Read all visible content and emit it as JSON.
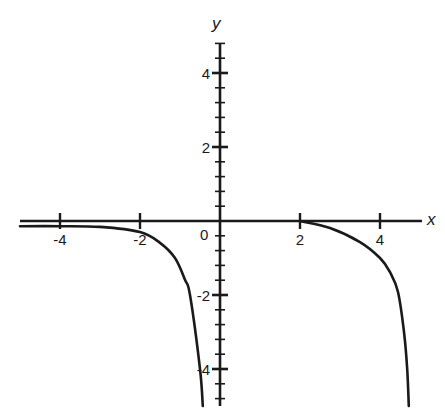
{
  "chart_data": {
    "type": "line",
    "title": "",
    "xlabel": "x",
    "ylabel": "y",
    "xlim": [
      -5,
      5
    ],
    "ylim": [
      -5,
      4.8
    ],
    "grid": false,
    "legend": null,
    "x_ticks": [
      -4,
      -2,
      2,
      4
    ],
    "x_tick_labels": [
      "-4",
      "-2",
      "2",
      "4"
    ],
    "y_ticks": [
      4,
      2,
      -2,
      -4
    ],
    "y_tick_labels": [
      "4",
      "2",
      "-2",
      "-4"
    ],
    "y_minor_tick_step": 0.4,
    "origin_label": "0",
    "series": [
      {
        "name": "left-branch",
        "x": [
          -5,
          -4,
          -3,
          -2,
          -1.5,
          -1.125,
          -0.875,
          -0.75,
          -0.5,
          -0.43
        ],
        "y": [
          -0.14,
          -0.14,
          -0.16,
          -0.3,
          -0.59,
          -1.0,
          -1.59,
          -2.0,
          -4.0,
          -5.0
        ]
      },
      {
        "name": "right-branch",
        "x": [
          2,
          2.75,
          3.5,
          4,
          4.25,
          4.45,
          4.6,
          4.68,
          4.72
        ],
        "y": [
          0,
          -0.19,
          -0.57,
          -1.0,
          -1.38,
          -1.92,
          -3.0,
          -4.0,
          -5.0
        ]
      }
    ],
    "annotations": []
  },
  "colors": {
    "axis": "#1a1a1a",
    "curve": "#1a1a1a",
    "background": "#ffffff"
  }
}
